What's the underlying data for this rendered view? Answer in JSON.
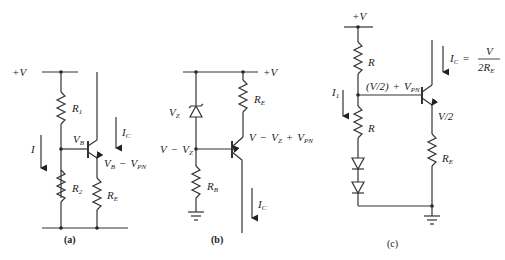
{
  "figure": {
    "panels": [
      {
        "id": "a",
        "caption": "(a)",
        "supply": "+V",
        "components": [
          "R1",
          "R2",
          "RE",
          "NPN transistor"
        ],
        "labels": {
          "supply": "+V",
          "r1": "R",
          "r1_sub": "1",
          "r2": "R",
          "r2_sub": "2",
          "re": "R",
          "re_sub": "E",
          "vb": "V",
          "vb_sub": "B",
          "ic": "I",
          "ic_sub": "C",
          "i": "I",
          "ve_a": "V",
          "ve_a_sub": "B",
          "ve_op": "−",
          "ve_b": "V",
          "ve_b_sub": "PN"
        }
      },
      {
        "id": "b",
        "caption": "(b)",
        "supply": "+V",
        "components": [
          "Zener diode VZ",
          "RB",
          "RE",
          "PNP transistor"
        ],
        "labels": {
          "supply": "+V",
          "vz": "V",
          "vz_sub": "Z",
          "re": "R",
          "re_sub": "E",
          "rb": "R",
          "rb_sub": "B",
          "vbase_a": "V",
          "vbase_op": "−",
          "vbase_b": "V",
          "vbase_b_sub": "Z",
          "ve_a": "V",
          "ve_op1": "−",
          "ve_b": "V",
          "ve_b_sub": "Z",
          "ve_op2": "+",
          "ve_c": "V",
          "ve_c_sub": "PN",
          "ic": "I",
          "ic_sub": "C"
        }
      },
      {
        "id": "c",
        "caption": "(c)",
        "supply": "+V",
        "components": [
          "R",
          "R",
          "two diodes",
          "RE",
          "NPN transistor"
        ],
        "labels": {
          "supply": "+V",
          "r_top": "R",
          "r_bot": "R",
          "re": "R",
          "re_sub": "E",
          "i1": "I",
          "i1_sub": "1",
          "vbase": "(V/2)",
          "vbase_op": "+",
          "vbase_b": "V",
          "vbase_b_sub": "PN",
          "ve": "V/2",
          "ic": "I",
          "ic_sub": "C",
          "ic_eq": "=",
          "ic_num": "V",
          "ic_den": "2R",
          "ic_den_sub": "E"
        }
      }
    ]
  }
}
